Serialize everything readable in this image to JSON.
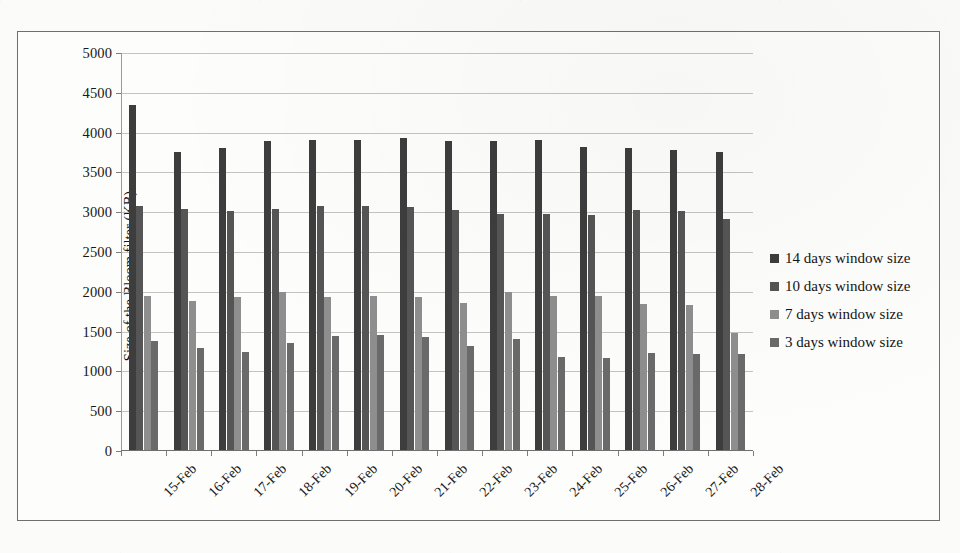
{
  "chart_data": {
    "type": "bar",
    "title": "",
    "xlabel": "",
    "ylabel": "Size of the Bloom filter (KB)",
    "ylim": [
      0,
      5000
    ],
    "ytick_step": 500,
    "yticks": [
      0,
      500,
      1000,
      1500,
      2000,
      2500,
      3000,
      3500,
      4000,
      4500,
      5000
    ],
    "ytick_labels": [
      "0",
      "500",
      "1000",
      "1500",
      "2000",
      "2500",
      "3000",
      "3500",
      "4000",
      "4500",
      "5000"
    ],
    "grid": true,
    "legend_position": "right",
    "categories": [
      "15-Feb",
      "16-Feb",
      "17-Feb",
      "18-Feb",
      "19-Feb",
      "20-Feb",
      "21-Feb",
      "22-Feb",
      "23-Feb",
      "24-Feb",
      "25-Feb",
      "26-Feb",
      "27-Feb",
      "28-Feb"
    ],
    "series": [
      {
        "name": "14 days window size",
        "color": "#3d3d3d",
        "values": [
          4330,
          3750,
          3800,
          3880,
          3890,
          3890,
          3920,
          3880,
          3880,
          3890,
          3810,
          3800,
          3770,
          3740
        ]
      },
      {
        "name": "10 days window size",
        "color": "#555555",
        "values": [
          3060,
          3030,
          3000,
          3030,
          3070,
          3070,
          3050,
          3020,
          2970,
          2960,
          2950,
          3020,
          3000,
          2900
        ]
      },
      {
        "name": "7 days window size",
        "color": "#8e8e8e",
        "values": [
          1940,
          1870,
          1920,
          1990,
          1920,
          1940,
          1920,
          1850,
          1990,
          1940,
          1930,
          1840,
          1820,
          1470
        ]
      },
      {
        "name": "3 days window size",
        "color": "#6a6a6a",
        "values": [
          1370,
          1280,
          1230,
          1340,
          1430,
          1450,
          1420,
          1310,
          1390,
          1170,
          1160,
          1220,
          1200,
          1200
        ]
      }
    ]
  },
  "legend": {
    "items": [
      {
        "label": "14 days window size",
        "color": "#3d3d3d"
      },
      {
        "label": "10 days window size",
        "color": "#555555"
      },
      {
        "label": "7 days window size",
        "color": "#8e8e8e"
      },
      {
        "label": "3 days window size",
        "color": "#6a6a6a"
      }
    ]
  }
}
